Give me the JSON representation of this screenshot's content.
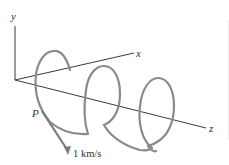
{
  "diagram": {
    "type": "3d-helix-trajectory",
    "axes": {
      "y_label": "y",
      "x_label": "x",
      "z_label": "z"
    },
    "point": {
      "label": "P"
    },
    "velocity_vector": {
      "label": "1 km/s"
    },
    "helix": {
      "turns": 3,
      "axis": "z"
    },
    "colors": {
      "axis": "#3a3a3a",
      "helix": "#8a8a8a",
      "vector": "#7a7a7a",
      "text": "#333333"
    }
  }
}
